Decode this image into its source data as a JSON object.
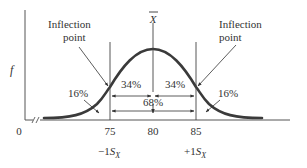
{
  "diagram": {
    "type": "normal-distribution",
    "y_axis_label": "f",
    "origin_label": "0",
    "mean_label": "X",
    "mean_overbar": true,
    "ticks": [
      {
        "value": "75",
        "sublabel_sign": "−1",
        "sublabel_var": "S",
        "sublabel_sub": "X"
      },
      {
        "value": "80"
      },
      {
        "value": "85",
        "sublabel_sign": "+1",
        "sublabel_var": "S",
        "sublabel_sub": "X"
      }
    ],
    "annotations": {
      "inflection_left_line1": "Inflection",
      "inflection_left_line2": "point",
      "inflection_right_line1": "Inflection",
      "inflection_right_line2": "point",
      "tail_left": "16%",
      "tail_right": "16%",
      "center_left": "34%",
      "center_right": "34%",
      "center_total": "68%"
    },
    "colors": {
      "curve": "#3a3a3a",
      "axis": "#555555",
      "text": "#333333"
    }
  }
}
